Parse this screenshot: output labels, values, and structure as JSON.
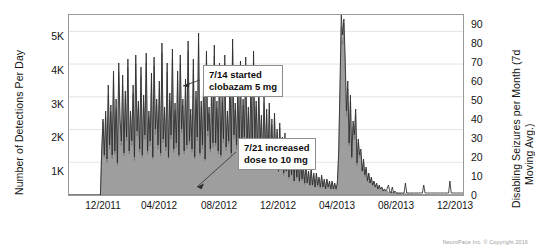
{
  "chart_data": {
    "type": "area",
    "title": "",
    "xlabel": "",
    "ylabel": "Number of Detections Per Day",
    "y2label_line1": "Disabling Seizures per Month (7d",
    "y2label_line2": "Moving Avg.)",
    "grid": true,
    "legend": "none",
    "ylim": [
      0,
      5500
    ],
    "y2lim": [
      0,
      90
    ],
    "yticks": [
      "1K",
      "2K",
      "3K",
      "4K",
      "5K"
    ],
    "ytick_values": [
      1000,
      2000,
      3000,
      4000,
      5000
    ],
    "y2ticks": [
      "0",
      "10",
      "20",
      "30",
      "40",
      "50",
      "60",
      "70",
      "80",
      "90"
    ],
    "y2tick_values": [
      0,
      10,
      20,
      30,
      40,
      50,
      60,
      70,
      80,
      90
    ],
    "xticks": [
      "12/2011",
      "04/2012",
      "08/2012",
      "12/2012",
      "04/2013",
      "08/2013",
      "12/2013"
    ],
    "xlim": [
      "10/2011",
      "02/2014"
    ],
    "annotations": [
      {
        "name": "clobazam-start",
        "text": "7/14 started\nclobazam 5 mg",
        "date": "07/14/2012",
        "points_to_value": 3300
      },
      {
        "name": "dose-increase",
        "text": "7/21 increased\ndose to 10 mg",
        "date": "07/21/2012",
        "points_to_value": 400
      }
    ],
    "footer": "NeuroPace Inc. © Copyright 2016",
    "colors": {
      "area_fill": "#9e9e9e",
      "area_line": "#6e6e6e",
      "seizure_line": "#2b2b2b",
      "axis": "#9a9a9a",
      "grid": "#d8d8d8",
      "text": "#141414",
      "callout_border": "#8e8e8e",
      "footer_text": "#9c9c9c"
    },
    "series": [
      {
        "name": "Number of Detections Per Day",
        "axis": "left",
        "render": "area",
        "values": [
          0,
          0,
          0,
          0,
          0,
          0,
          0,
          0,
          0,
          0,
          0,
          0,
          0,
          0,
          0,
          0,
          0,
          0,
          0,
          0,
          0,
          0,
          0,
          0,
          0,
          1450,
          2250,
          1150,
          2400,
          980,
          3050,
          1400,
          2550,
          1100,
          3550,
          1250,
          2650,
          900,
          3750,
          2100,
          1500,
          3350,
          1200,
          2950,
          1650,
          3900,
          1250,
          2400,
          1500,
          3100,
          1050,
          4000,
          1800,
          2650,
          1300,
          3650,
          1150,
          2850,
          1700,
          4050,
          1250,
          2400,
          1500,
          3450,
          1100,
          3950,
          1850,
          2750,
          1400,
          3250,
          1200,
          4350,
          1600,
          2500,
          1350,
          3750,
          1100,
          2900,
          1700,
          4150,
          1300,
          2600,
          1450,
          3500,
          1150,
          4000,
          1900,
          2750,
          1250,
          3300,
          1400,
          4400,
          1550,
          2450,
          1300,
          3850,
          1100,
          2950,
          1650,
          4600,
          1200,
          2700,
          1400,
          3600,
          1050,
          4100,
          1800,
          2500,
          1300,
          3200,
          1450,
          4250,
          1500,
          2650,
          1250,
          3750,
          1150,
          2850,
          1600,
          4000,
          1350,
          2400,
          1550,
          3400,
          1200,
          4450,
          1700,
          2600,
          1400,
          3150,
          1250,
          3800,
          1100,
          2750,
          1650,
          3950,
          1400,
          2500,
          1300,
          3300,
          1150,
          4100,
          1550,
          2700,
          1250,
          3000,
          1450,
          2300,
          1050,
          2800,
          1200,
          2450,
          900,
          2600,
          1100,
          2150,
          800,
          2350,
          950,
          1900,
          700,
          2050,
          850,
          1650,
          600,
          1750,
          700,
          1400,
          500,
          1500,
          600,
          1200,
          420,
          1300,
          500,
          1000,
          380,
          1100,
          430,
          850,
          320,
          900,
          350,
          700,
          280,
          750,
          300,
          600,
          240,
          650,
          260,
          500,
          210,
          550,
          230,
          430,
          190,
          470,
          200,
          380,
          170,
          400,
          180,
          330,
          150,
          350,
          1200,
          3100,
          5150,
          4600,
          5250,
          3900,
          2400,
          3250,
          1500,
          2850,
          1100,
          2100,
          1700,
          2450,
          900,
          1600,
          1150,
          1300,
          700,
          1000,
          550,
          800,
          420,
          650,
          350,
          500,
          280,
          400,
          230,
          320,
          190,
          260,
          150,
          210,
          120,
          170,
          100,
          140,
          80,
          110,
          70,
          95,
          55,
          80,
          45,
          65,
          40,
          55,
          35,
          45,
          30,
          40,
          25,
          35,
          22,
          30,
          20,
          26,
          18,
          24,
          16,
          20,
          15,
          18,
          14,
          17,
          12,
          16,
          11,
          15,
          10,
          14,
          9,
          13,
          9,
          12,
          8,
          11,
          8,
          10,
          7,
          10,
          7,
          9,
          7,
          9,
          6,
          8,
          6,
          8,
          6,
          7,
          5,
          7,
          5,
          7
        ]
      },
      {
        "name": "Disabling Seizures per Month (7d Moving Avg.)",
        "axis": "right",
        "render": "line",
        "values": [
          0,
          0,
          0,
          0,
          0,
          0,
          0,
          0,
          0,
          0,
          0,
          0,
          0,
          0,
          0,
          0,
          0,
          0,
          0,
          0,
          0,
          0,
          0,
          0,
          0,
          22,
          38,
          20,
          42,
          18,
          55,
          25,
          45,
          20,
          62,
          22,
          48,
          16,
          66,
          38,
          27,
          60,
          21,
          52,
          29,
          68,
          22,
          42,
          27,
          55,
          19,
          70,
          32,
          47,
          23,
          64,
          20,
          50,
          30,
          71,
          22,
          42,
          27,
          61,
          19,
          69,
          33,
          48,
          25,
          57,
          21,
          76,
          28,
          44,
          24,
          66,
          19,
          51,
          30,
          73,
          23,
          46,
          26,
          62,
          20,
          70,
          33,
          48,
          22,
          58,
          25,
          77,
          27,
          43,
          23,
          68,
          19,
          52,
          29,
          81,
          21,
          47,
          25,
          63,
          18,
          72,
          32,
          44,
          23,
          56,
          26,
          75,
          26,
          47,
          22,
          66,
          20,
          50,
          28,
          70,
          24,
          42,
          27,
          60,
          21,
          78,
          30,
          46,
          25,
          55,
          22,
          67,
          19,
          48,
          29,
          69,
          25,
          44,
          23,
          58,
          20,
          72,
          27,
          47,
          22,
          53,
          26,
          40,
          18,
          49,
          21,
          43,
          16,
          46,
          19,
          38,
          14,
          41,
          17,
          33,
          12,
          36,
          15,
          29,
          11,
          31,
          12,
          25,
          9,
          26,
          10,
          21,
          7,
          23,
          9,
          18,
          7,
          19,
          8,
          15,
          6,
          16,
          6,
          12,
          5,
          13,
          5,
          11,
          4,
          11,
          5,
          9,
          4,
          10,
          4,
          8,
          3,
          8,
          4,
          7,
          3,
          7,
          3,
          6,
          3,
          6,
          21,
          54,
          90,
          80,
          88,
          68,
          42,
          57,
          26,
          50,
          19,
          37,
          30,
          43,
          16,
          28,
          20,
          23,
          12,
          18,
          10,
          14,
          7,
          11,
          6,
          9,
          5,
          7,
          4,
          6,
          3,
          5,
          3,
          4,
          2,
          3,
          2,
          3,
          5,
          2,
          1,
          4,
          1,
          2,
          1,
          1,
          1,
          1,
          1,
          1,
          1,
          6,
          1,
          1,
          1,
          1,
          1,
          1,
          1,
          1,
          1,
          1,
          1,
          1,
          1,
          5,
          1,
          1,
          1,
          1,
          1,
          1,
          1,
          1,
          1,
          1,
          1,
          1,
          1,
          1,
          1,
          1,
          1,
          1,
          1,
          7,
          1,
          1,
          1,
          1,
          1,
          1,
          1,
          1,
          1,
          1
        ]
      }
    ]
  }
}
